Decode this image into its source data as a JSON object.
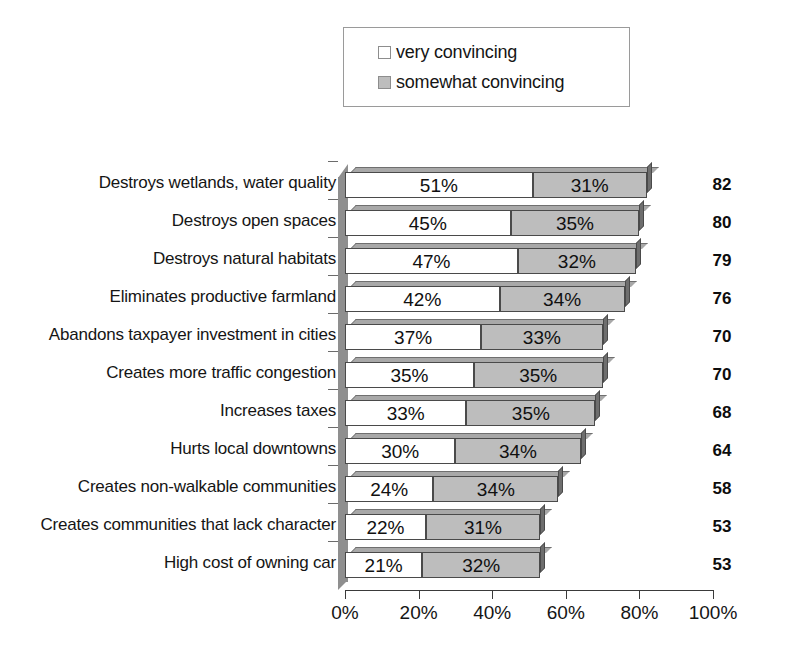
{
  "legend": {
    "items": [
      {
        "label": "very convincing",
        "swatch": "very",
        "color": "#ffffff"
      },
      {
        "label": "somewhat convincing",
        "swatch": "somewhat",
        "color": "#bdbdbd"
      }
    ]
  },
  "chart_data": {
    "type": "bar",
    "orientation": "horizontal",
    "stacked": true,
    "title": "",
    "xlabel": "",
    "ylabel": "",
    "xlim": [
      0,
      100
    ],
    "grid": false,
    "legend_position": "top-center",
    "tick_labels": [
      "0%",
      "20%",
      "40%",
      "60%",
      "80%",
      "100%"
    ],
    "tick_values": [
      0,
      20,
      40,
      60,
      80,
      100
    ],
    "categories": [
      "Destroys wetlands, water quality",
      "Destroys open spaces",
      "Destroys natural habitats",
      "Eliminates productive farmland",
      "Abandons taxpayer investment in cities",
      "Creates more traffic congestion",
      "Increases taxes",
      "Hurts local downtowns",
      "Creates non-walkable communities",
      "Creates communities that lack character",
      "High cost of owning car"
    ],
    "series": [
      {
        "name": "very convincing",
        "values": [
          51,
          45,
          47,
          42,
          37,
          35,
          33,
          30,
          24,
          22,
          21
        ]
      },
      {
        "name": "somewhat convincing",
        "values": [
          31,
          35,
          32,
          34,
          33,
          35,
          35,
          34,
          34,
          31,
          32
        ]
      }
    ],
    "value_labels": [
      [
        "51%",
        "31%"
      ],
      [
        "45%",
        "35%"
      ],
      [
        "47%",
        "32%"
      ],
      [
        "42%",
        "34%"
      ],
      [
        "37%",
        "33%"
      ],
      [
        "35%",
        "35%"
      ],
      [
        "33%",
        "35%"
      ],
      [
        "30%",
        "34%"
      ],
      [
        "24%",
        "34%"
      ],
      [
        "22%",
        "31%"
      ],
      [
        "21%",
        "32%"
      ]
    ],
    "totals": [
      82,
      80,
      79,
      76,
      70,
      70,
      68,
      64,
      58,
      53,
      53
    ]
  }
}
